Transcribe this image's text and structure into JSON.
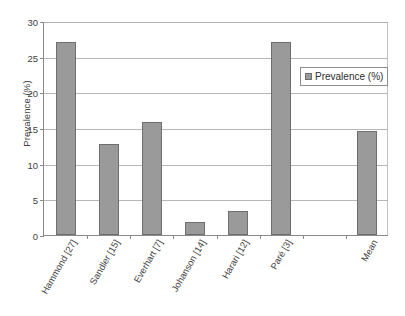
{
  "chart_data": {
    "type": "bar",
    "title": "",
    "xlabel": "",
    "ylabel": "Prevalence (%)",
    "ylim": [
      0,
      30
    ],
    "yticks": [
      0,
      5,
      10,
      15,
      20,
      25,
      30
    ],
    "ytick_labels": [
      "0",
      "5",
      "10",
      "15",
      "20",
      "25",
      "30"
    ],
    "grid": true,
    "legend_position": "upper right",
    "categories": [
      "Hammond [27]",
      "Sandler [15]",
      "Everhart [7]",
      "Johanson [14]",
      "Harari [12]",
      "Paré [3]",
      "",
      "Mean"
    ],
    "series": [
      {
        "name": "Prevalence (%)",
        "color": "#9a9a9a",
        "values": [
          27.0,
          12.8,
          15.8,
          1.8,
          3.3,
          27.0,
          null,
          14.6
        ]
      }
    ]
  },
  "legend": {
    "entries": [
      {
        "label": "Prevalence (%)",
        "swatch_name": "legend-swatch-prevalence"
      }
    ]
  },
  "axes": {
    "y_title": "Prevalence (%)"
  }
}
